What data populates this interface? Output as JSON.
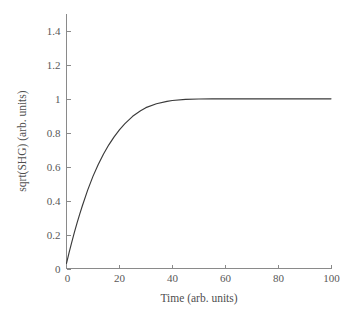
{
  "chart_data": {
    "type": "line",
    "title": "",
    "subtitle": "",
    "xlabel": "Time (arb. units)",
    "ylabel": "sqrt(SHG) (arb. units)",
    "xlim": [
      0,
      100
    ],
    "ylim": [
      0,
      1.5
    ],
    "xticks": [
      0,
      20,
      40,
      60,
      80,
      100
    ],
    "xtick_labels": [
      "0",
      "20",
      "40",
      "60",
      "80",
      "100"
    ],
    "yticks": [
      0,
      0.2,
      0.4,
      0.6,
      0.8,
      1,
      1.2,
      1.4
    ],
    "ytick_labels": [
      "0",
      "0.2",
      "0.4",
      "0.6",
      "0.8",
      "1",
      "1.2",
      "1.4"
    ],
    "grid": false,
    "legend": "none",
    "tick_direction": "in",
    "spines": [
      "left",
      "bottom"
    ],
    "series": [
      {
        "name": "sqrt(SHG)",
        "color": "#3a3a3a",
        "x": [
          0,
          1,
          2,
          3,
          4,
          5,
          6,
          8,
          10,
          12,
          14,
          16,
          18,
          20,
          22,
          25,
          28,
          30,
          34,
          38,
          40,
          45,
          50,
          55,
          60,
          65,
          70,
          75,
          80,
          85,
          90,
          95,
          100
        ],
        "values": [
          0.03,
          0.095,
          0.156,
          0.214,
          0.269,
          0.321,
          0.37,
          0.462,
          0.543,
          0.613,
          0.675,
          0.729,
          0.776,
          0.817,
          0.852,
          0.897,
          0.93,
          0.948,
          0.971,
          0.985,
          0.99,
          0.997,
          0.999,
          1.0,
          1.0,
          1.0,
          1.0,
          1.0,
          1.0,
          1.0,
          1.0,
          1.0,
          1.0
        ]
      }
    ],
    "annotations": []
  },
  "axis": {
    "x_title": "Time (arb. units)",
    "y_title": "sqrt(SHG) (arb. units)"
  }
}
